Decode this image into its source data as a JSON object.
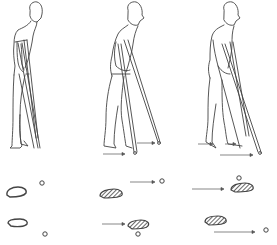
{
  "figure": {
    "line_color": "#333333",
    "fill_color": "#555555",
    "background": "#ffffff",
    "panels": [
      {
        "id": "stage-1",
        "label": "Standing with both crutches"
      },
      {
        "id": "stage-2",
        "label": "Advancing crutch and opposite foot"
      },
      {
        "id": "stage-3",
        "label": "Advancing second crutch and foot"
      }
    ],
    "gait_rows": [
      {
        "row": "top",
        "items": [
          "footprint",
          "crutch-tip"
        ]
      },
      {
        "row": "bottom",
        "items": [
          "footprint",
          "crutch-tip"
        ]
      }
    ]
  }
}
